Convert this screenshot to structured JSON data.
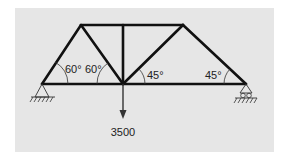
{
  "diagram": {
    "type": "truss",
    "panel_color": "#e6e6e6",
    "member_color": "#111111",
    "load": {
      "label": "3500",
      "direction": "down",
      "node": "bottom-center"
    },
    "angles": [
      {
        "label": "60°",
        "position": "left-support"
      },
      {
        "label": "60°",
        "position": "bottom-center-left"
      },
      {
        "label": "45°",
        "position": "bottom-center-right"
      },
      {
        "label": "45°",
        "position": "right-support"
      }
    ],
    "supports": [
      {
        "type": "pin",
        "position": "left"
      },
      {
        "type": "roller",
        "position": "right"
      }
    ]
  }
}
